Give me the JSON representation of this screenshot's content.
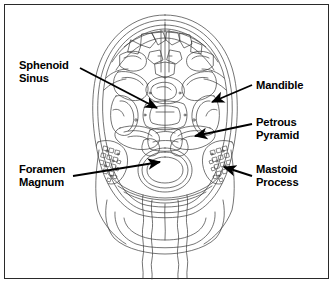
{
  "figure": {
    "border_color": "#2a2a2a",
    "background_color": "#ffffff",
    "line_color": "#3a3a3a",
    "label_color": "#000000"
  },
  "labels": [
    {
      "id": "sphenoid-sinus",
      "side": "left",
      "lines": [
        "Sphenoid",
        "Sinus"
      ],
      "leader": {
        "x1": 80,
        "y1": 68,
        "x2": 157,
        "y2": 108
      }
    },
    {
      "id": "mandible",
      "side": "right",
      "lines": [
        "Mandible"
      ],
      "leader": {
        "x1": 252,
        "y1": 85,
        "x2": 212,
        "y2": 102
      }
    },
    {
      "id": "petrous-pyramid",
      "side": "right",
      "lines": [
        "Petrous",
        "Pyramid"
      ],
      "leader": {
        "x1": 252,
        "y1": 124,
        "x2": 195,
        "y2": 136
      }
    },
    {
      "id": "mastoid-process",
      "side": "right",
      "lines": [
        "Mastoid",
        "Process"
      ],
      "leader": {
        "x1": 252,
        "y1": 176,
        "x2": 224,
        "y2": 167
      }
    },
    {
      "id": "foramen-magnum",
      "side": "left",
      "lines": [
        "Foramen",
        "Magnum"
      ],
      "leader": {
        "x1": 73,
        "y1": 176,
        "x2": 160,
        "y2": 162
      }
    }
  ]
}
